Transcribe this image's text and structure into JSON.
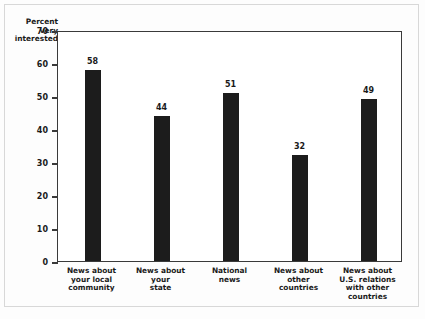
{
  "chart_data": {
    "type": "bar",
    "title": "",
    "subtitle": "",
    "xlabel": "",
    "ylabel": "Percent\nvery\ninterested",
    "ylim": [
      0,
      70
    ],
    "yticks": [
      0,
      10,
      20,
      30,
      40,
      50,
      60,
      70
    ],
    "ytick_labels": [
      "0",
      "10",
      "20",
      "30",
      "40",
      "50",
      "60",
      "70"
    ],
    "grid": false,
    "legend": null,
    "bar_color": "#1c1c1c",
    "categories": [
      "News about\nyour local\ncommunity",
      "News about\nyour\nstate",
      "National\nnews",
      "News about\nother\ncountries",
      "News about\nU.S. relations\nwith other\ncountries"
    ],
    "values": [
      58,
      44,
      51,
      32,
      49
    ],
    "value_labels": [
      "58",
      "44",
      "51",
      "32",
      "49"
    ]
  },
  "style": {
    "axis_color": "#3a3a3a",
    "text_color": "#1a1a1a",
    "background": "#ffffff",
    "frame_color": "#d8d8d8"
  }
}
